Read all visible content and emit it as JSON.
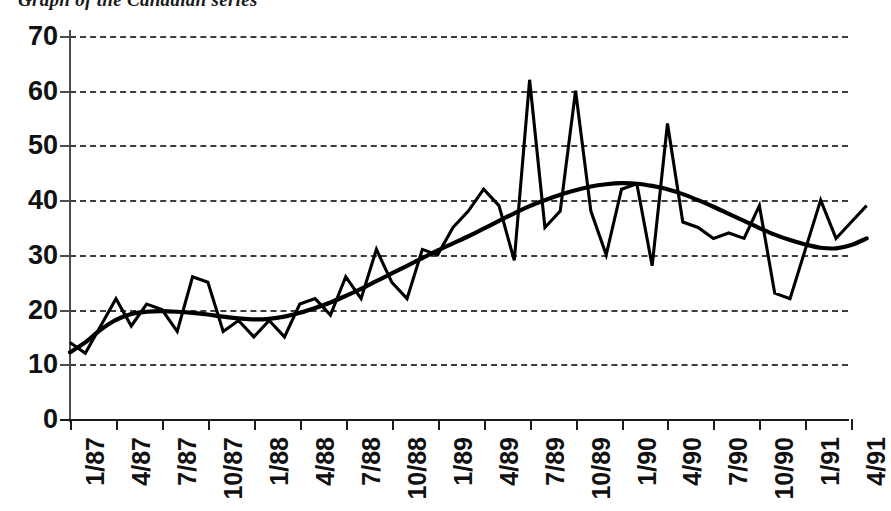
{
  "chart_data": {
    "type": "line",
    "title": "Graph of the Canadian series",
    "xlabel": "",
    "ylabel": "",
    "ylim": [
      0,
      70
    ],
    "ytick_labels": [
      "0",
      "10",
      "20",
      "30",
      "40",
      "50",
      "60",
      "70"
    ],
    "ytick_values": [
      0,
      10,
      20,
      30,
      40,
      50,
      60,
      70
    ],
    "grid": true,
    "grid_style": "dashed",
    "legend": "none",
    "xtick_labels": [
      "1/87",
      "4/87",
      "7/87",
      "10/87",
      "1/88",
      "4/88",
      "7/88",
      "10/88",
      "1/89",
      "4/89",
      "7/89",
      "10/89",
      "1/90",
      "4/90",
      "7/90",
      "10/90",
      "1/91",
      "4/91"
    ],
    "xtick_interval_months": 3,
    "x": [
      "1/87",
      "2/87",
      "3/87",
      "4/87",
      "5/87",
      "6/87",
      "7/87",
      "8/87",
      "9/87",
      "10/87",
      "11/87",
      "12/87",
      "1/88",
      "2/88",
      "3/88",
      "4/88",
      "5/88",
      "6/88",
      "7/88",
      "8/88",
      "9/88",
      "10/88",
      "11/88",
      "12/88",
      "1/89",
      "2/89",
      "3/89",
      "4/89",
      "5/89",
      "6/89",
      "7/89",
      "8/89",
      "9/89",
      "10/89",
      "11/89",
      "12/89",
      "1/90",
      "2/90",
      "3/90",
      "4/90",
      "5/90",
      "6/90",
      "7/90",
      "8/90",
      "9/90",
      "10/90",
      "11/90",
      "12/90",
      "1/91",
      "2/91",
      "3/91",
      "4/91",
      "5/91"
    ],
    "series": [
      {
        "name": "observed",
        "style": "jagged",
        "values": [
          14,
          12,
          17,
          22,
          17,
          21,
          20,
          16,
          26,
          25,
          16,
          18,
          15,
          18,
          15,
          21,
          22,
          19,
          26,
          22,
          31,
          25,
          22,
          31,
          30,
          35,
          38,
          42,
          39,
          29,
          62,
          35,
          38,
          60,
          38,
          30,
          42,
          43,
          28,
          54,
          36,
          35,
          33,
          34,
          33,
          39,
          23,
          22,
          31,
          40,
          33,
          36,
          39
        ]
      },
      {
        "name": "smoothed-trend",
        "style": "smooth",
        "values": [
          12.2,
          14.0,
          16.3,
          18.1,
          19.2,
          19.6,
          19.7,
          19.6,
          19.4,
          19.1,
          18.7,
          18.4,
          18.2,
          18.3,
          18.7,
          19.4,
          20.3,
          21.3,
          22.5,
          23.8,
          25.2,
          26.6,
          28.0,
          29.4,
          30.8,
          32.1,
          33.4,
          34.8,
          36.2,
          37.6,
          38.9,
          40.0,
          41.0,
          41.8,
          42.5,
          42.9,
          43.1,
          43.0,
          42.6,
          42.0,
          41.1,
          40.0,
          38.8,
          37.5,
          36.2,
          34.9,
          33.7,
          32.7,
          31.9,
          31.3,
          31.2,
          31.8,
          33.0
        ]
      }
    ]
  }
}
